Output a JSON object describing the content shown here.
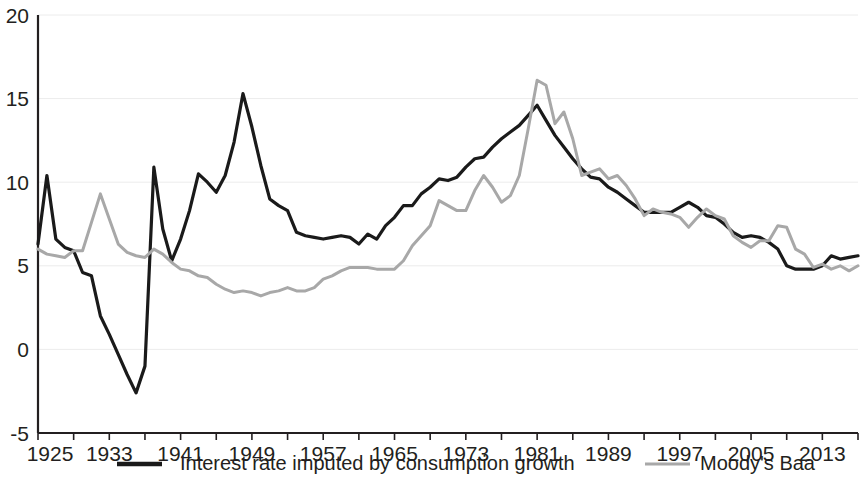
{
  "chart_data": {
    "type": "line",
    "title": "",
    "subtitle": "",
    "xlabel": "",
    "ylabel": "",
    "xlim": [
      1925,
      2017
    ],
    "ylim": [
      -5,
      20
    ],
    "grid": true,
    "legend_position": "bottom",
    "y_ticks": [
      -5,
      0,
      5,
      10,
      15,
      20
    ],
    "y_tick_labels": [
      "-5",
      "0",
      "5",
      "10",
      "15",
      "20"
    ],
    "x_ticks": [
      1925,
      1933,
      1941,
      1949,
      1957,
      1965,
      1973,
      1981,
      1989,
      1997,
      2005,
      2013
    ],
    "x_tick_labels": [
      "1925",
      "1933",
      "1941",
      "1949",
      "1957",
      "1965",
      "1973",
      "1981",
      "1989",
      "1997",
      "2005",
      "2013"
    ],
    "x_minor_tick_step": 4,
    "x": [
      1925,
      1926,
      1927,
      1928,
      1929,
      1930,
      1931,
      1932,
      1933,
      1934,
      1935,
      1936,
      1937,
      1938,
      1939,
      1940,
      1941,
      1942,
      1943,
      1944,
      1945,
      1946,
      1947,
      1948,
      1949,
      1950,
      1951,
      1952,
      1953,
      1954,
      1955,
      1956,
      1957,
      1958,
      1959,
      1960,
      1961,
      1962,
      1963,
      1964,
      1965,
      1966,
      1967,
      1968,
      1969,
      1970,
      1971,
      1972,
      1973,
      1974,
      1975,
      1976,
      1977,
      1978,
      1979,
      1980,
      1981,
      1982,
      1983,
      1984,
      1985,
      1986,
      1987,
      1988,
      1989,
      1990,
      1991,
      1992,
      1993,
      1994,
      1995,
      1996,
      1997,
      1998,
      1999,
      2000,
      2001,
      2002,
      2003,
      2004,
      2005,
      2006,
      2007,
      2008,
      2009,
      2010,
      2011,
      2012,
      2013,
      2014,
      2015,
      2016,
      2017
    ],
    "series": [
      {
        "name": "Interest rate imputed by consumption growth",
        "color": "#1a1a1a",
        "linewidth": 3.2,
        "values": [
          6.3,
          10.4,
          6.6,
          6.1,
          5.9,
          4.6,
          4.4,
          2.0,
          0.9,
          -0.3,
          -1.5,
          -2.6,
          -1.0,
          10.9,
          7.2,
          5.3,
          6.6,
          8.3,
          10.5,
          10.0,
          9.4,
          10.4,
          12.4,
          15.3,
          13.3,
          11.0,
          9.0,
          8.6,
          8.3,
          7.0,
          6.8,
          6.7,
          6.6,
          6.7,
          6.8,
          6.7,
          6.3,
          6.9,
          6.6,
          7.4,
          7.9,
          8.6,
          8.6,
          9.3,
          9.7,
          10.2,
          10.1,
          10.3,
          10.9,
          11.4,
          11.5,
          12.1,
          12.6,
          13.0,
          13.4,
          14.0,
          14.6,
          13.7,
          12.8,
          12.1,
          11.4,
          10.8,
          10.3,
          10.2,
          9.7,
          9.4,
          9.0,
          8.6,
          8.2,
          8.2,
          8.2,
          8.2,
          8.5,
          8.8,
          8.5,
          8.0,
          7.9,
          7.5,
          7.0,
          6.7,
          6.8,
          6.7,
          6.4,
          6.0,
          5.0,
          4.8,
          4.8,
          4.8,
          5.0,
          5.6,
          5.4,
          5.5,
          5.6
        ]
      },
      {
        "name": "Moody's Baa",
        "color": "#a8a8a8",
        "linewidth": 3.0,
        "values": [
          6.0,
          5.7,
          5.6,
          5.5,
          5.9,
          5.9,
          7.6,
          9.3,
          7.8,
          6.3,
          5.8,
          5.6,
          5.5,
          6.0,
          5.7,
          5.2,
          4.8,
          4.7,
          4.4,
          4.3,
          3.9,
          3.6,
          3.4,
          3.5,
          3.4,
          3.2,
          3.4,
          3.5,
          3.7,
          3.5,
          3.5,
          3.7,
          4.2,
          4.4,
          4.7,
          4.9,
          4.9,
          4.9,
          4.8,
          4.8,
          4.8,
          5.3,
          6.2,
          6.8,
          7.4,
          8.9,
          8.6,
          8.3,
          8.3,
          9.5,
          10.4,
          9.7,
          8.8,
          9.2,
          10.4,
          13.2,
          16.1,
          15.8,
          13.5,
          14.2,
          12.6,
          10.4,
          10.6,
          10.8,
          10.2,
          10.4,
          9.8,
          9.0,
          8.0,
          8.4,
          8.2,
          8.1,
          7.9,
          7.3,
          7.9,
          8.4,
          8.0,
          7.8,
          6.8,
          6.4,
          6.1,
          6.5,
          6.5,
          7.4,
          7.3,
          6.0,
          5.7,
          4.9,
          5.1,
          4.8,
          5.0,
          4.7,
          5.0
        ]
      }
    ]
  },
  "legend": {
    "items": [
      {
        "label": "Interest rate imputed by consumption growth",
        "color": "#1a1a1a"
      },
      {
        "label": "Moody's Baa",
        "color": "#a8a8a8"
      }
    ]
  },
  "layout": {
    "plot_left": 38,
    "plot_right": 858,
    "plot_top": 15,
    "plot_bottom": 433
  }
}
